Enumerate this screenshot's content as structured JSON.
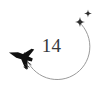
{
  "widget": {
    "name": "flight-countdown-badge",
    "background_color": "#ffffff"
  },
  "count": {
    "value": "14",
    "color": "#35383c"
  },
  "orbit": {
    "label": "circular-flight-path",
    "stroke_color": "#9a9a9a",
    "stroke_width": "1",
    "center_x": "57",
    "center_y": "45",
    "radius": "33"
  },
  "airplane": {
    "label": "airplane-icon",
    "fill_color": "#111111",
    "heading": "left",
    "x": "21",
    "y": "56"
  },
  "trail": {
    "label": "motion-trail",
    "stroke_color": "#3a3a3a",
    "dash_count": "3"
  },
  "sparkles": [
    {
      "label": "sparkle-large",
      "x": "80",
      "y": "22",
      "size": "9",
      "color": "#2f2f2f"
    },
    {
      "label": "sparkle-small",
      "x": "88",
      "y": "13",
      "size": "6",
      "color": "#2f2f2f"
    }
  ]
}
